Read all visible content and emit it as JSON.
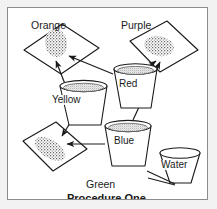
{
  "figure": {
    "caption": "Procedure One",
    "frame_color": "#8c8c8c",
    "background_color": "#f2f2f2",
    "page_color": "#ffffff",
    "ink_color": "#1a1a1a"
  },
  "slides": [
    {
      "id": "orange",
      "label": "Orange",
      "label_position": "top-left",
      "blob": "stippled-spot"
    },
    {
      "id": "purple",
      "label": "Purple",
      "label_position": "top-right",
      "blob": "stippled-spot"
    },
    {
      "id": "green",
      "label": "Green",
      "label_position": "bottom-left",
      "blob": "stippled-spot"
    }
  ],
  "cups": [
    {
      "id": "yellow",
      "label": "Yellow",
      "filled": true
    },
    {
      "id": "red",
      "label": "Red",
      "filled": true
    },
    {
      "id": "blue",
      "label": "Blue",
      "filled": true
    },
    {
      "id": "water",
      "label": "Water",
      "filled": false
    }
  ],
  "arrows": [
    {
      "from": "yellow",
      "to": "orange"
    },
    {
      "from": "red",
      "to": "orange"
    },
    {
      "from": "red",
      "to": "purple"
    },
    {
      "from": "blue",
      "to": "purple"
    },
    {
      "from": "yellow",
      "to": "green"
    },
    {
      "from": "blue",
      "to": "green"
    }
  ],
  "tools": {
    "name": "tweezers",
    "near": "water"
  }
}
